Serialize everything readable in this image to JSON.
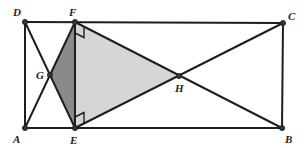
{
  "diagram": {
    "type": "geometry",
    "colors": {
      "line": "#1e1e1e",
      "dark_fill": "#8a8a8a",
      "light_fill": "#d6d6d6",
      "background": "#ffffff"
    },
    "points": {
      "A": {
        "label": "A",
        "x": 25,
        "y": 128
      },
      "B": {
        "label": "B",
        "x": 282,
        "y": 128
      },
      "C": {
        "label": "C",
        "x": 283,
        "y": 23
      },
      "D": {
        "label": "D",
        "x": 25,
        "y": 22
      },
      "E": {
        "label": "E",
        "x": 75,
        "y": 128
      },
      "F": {
        "label": "F",
        "x": 75,
        "y": 22
      },
      "G": {
        "label": "G",
        "x": 50,
        "y": 75
      },
      "H": {
        "label": "H",
        "x": 179,
        "y": 76
      }
    },
    "labels": {
      "A": "A",
      "B": "B",
      "C": "C",
      "D": "D",
      "E": "E",
      "F": "F",
      "G": "G",
      "H": "H"
    },
    "segments": [
      [
        "D",
        "C"
      ],
      [
        "C",
        "B"
      ],
      [
        "B",
        "A"
      ],
      [
        "A",
        "D"
      ],
      [
        "F",
        "E"
      ],
      [
        "D",
        "E"
      ],
      [
        "A",
        "F"
      ],
      [
        "F",
        "B"
      ],
      [
        "E",
        "C"
      ]
    ],
    "shaded_regions": [
      {
        "name": "triangle-GFE",
        "vertices": [
          "G",
          "F",
          "E"
        ],
        "shade": "dark"
      },
      {
        "name": "triangle-FEH",
        "vertices": [
          "F",
          "E",
          "H"
        ],
        "shade": "light"
      }
    ],
    "right_angle_marks": [
      "F",
      "E"
    ]
  }
}
